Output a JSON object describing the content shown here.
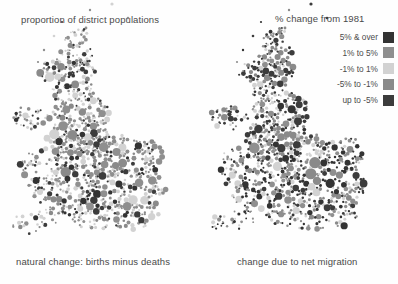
{
  "figure": {
    "background": "#ffffff",
    "text_color": "#4a4a4a"
  },
  "left_panel": {
    "top_caption": "proportion of district populations",
    "bottom_caption": "natural change: births minus deaths"
  },
  "right_panel": {
    "top_caption": "% change from 1981",
    "bottom_caption": "change due to net migration"
  },
  "legend": {
    "title": "% change from 1981",
    "items": [
      {
        "label": "5% & over",
        "color": "#333333"
      },
      {
        "label": "1% to 5%",
        "color": "#8f8f8f"
      },
      {
        "label": "-1% to 1%",
        "color": "#d2d2d2"
      },
      {
        "label": "-5% to -1%",
        "color": "#8a8a8a"
      },
      {
        "label": "up to -5%",
        "color": "#3c3c3c"
      }
    ]
  },
  "chart_data": {
    "type": "scatter",
    "subtitle": "proportion of district populations / % change from 1981",
    "xlabel": "",
    "ylabel": "",
    "grid": false,
    "legend_position": "top-right",
    "encoding": {
      "circle_area": "proportion of district population",
      "circle_fill": "% change from 1981"
    },
    "class_breaks": [
      "5% & over",
      "1% to 5%",
      "-1% to 1%",
      "-5% to -1%",
      "up to -5%"
    ],
    "class_colors": [
      "#333333",
      "#8f8f8f",
      "#d2d2d2",
      "#8a8a8a",
      "#3c3c3c"
    ],
    "panels": [
      {
        "name": "natural change: births minus deaths",
        "class_counts": [
          63,
          142,
          118,
          96,
          71
        ]
      },
      {
        "name": "change due to net migration",
        "class_counts": [
          88,
          121,
          95,
          110,
          126
        ]
      }
    ]
  }
}
